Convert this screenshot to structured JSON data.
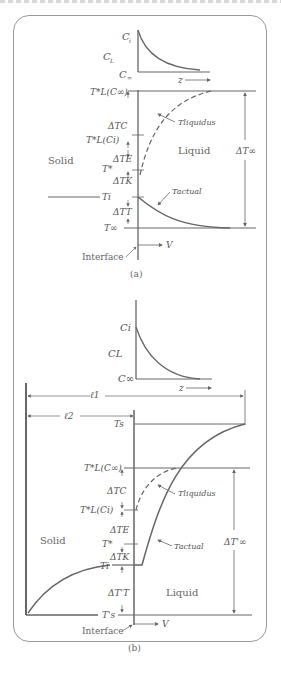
{
  "figure": {
    "panel_a": {
      "caption": "(a)",
      "concentration_plot": {
        "labels": {
          "ci": "C",
          "ci_sub": "i",
          "cl": "C",
          "cl_sub": "L",
          "cinf": "C",
          "cinf_sub": "∞",
          "z": "z"
        }
      },
      "temperature_plot": {
        "labels": {
          "tl_cinf": "T*L(C∞)",
          "dtc": "ΔTC",
          "tl_ci": "T*L(Ci)",
          "dte": "ΔTE",
          "tstar": "T*",
          "dtk": "ΔTK",
          "ti": "Ti",
          "dtt": "ΔTT",
          "tinf": "T∞",
          "t_liquidus": "Tliquidus",
          "t_actual": "Tactual",
          "dt_inf": "ΔT∞",
          "solid": "Solid",
          "liquid": "Liquid",
          "interface": "Interface",
          "v": "V"
        }
      }
    },
    "panel_b": {
      "caption": "(b)",
      "concentration_plot": {
        "labels": {
          "ci": "Ci",
          "cl": "CL",
          "cinf": "C∞",
          "z": "z"
        }
      },
      "temperature_plot": {
        "labels": {
          "l1": "ℓ1",
          "l2": "ℓ2",
          "ts": "Ts",
          "tl_cinf": "T*L(C∞)",
          "dtc": "ΔTC",
          "tl_ci": "T*L(Ci)",
          "dte": "ΔTE",
          "tstar": "T*",
          "dtk": "ΔTK",
          "ti": "Ti",
          "dtt": "ΔT'T",
          "ts_prime": "T's",
          "t_liquidus": "Tliquidus",
          "t_actual": "Tactual",
          "dt_inf": "ΔT'∞",
          "solid": "Solid",
          "liquid": "Liquid",
          "interface": "Interface",
          "v": "V"
        }
      }
    }
  }
}
